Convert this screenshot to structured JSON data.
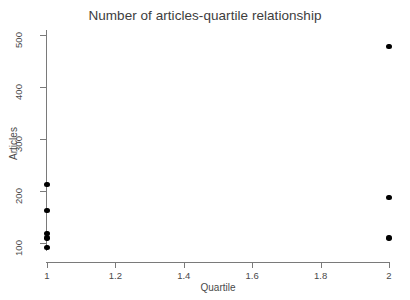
{
  "chart_data": {
    "type": "scatter",
    "title": "Number of articles-quartile relationship",
    "xlabel": "Quartile",
    "ylabel": "Articles",
    "xlim": [
      1,
      2
    ],
    "ylim": [
      80,
      510
    ],
    "grid": false,
    "legend": null,
    "marker": {
      "shape": "circle",
      "filled": true,
      "color": "#000000",
      "size_px": 5.4
    },
    "x_ticks": [
      {
        "value": 1,
        "label": "1"
      },
      {
        "value": 1.2,
        "label": "1.2"
      },
      {
        "value": 1.4,
        "label": "1.4"
      },
      {
        "value": 1.6,
        "label": "1.6"
      },
      {
        "value": 1.8,
        "label": "1.8"
      },
      {
        "value": 2,
        "label": "2"
      }
    ],
    "y_ticks": [
      {
        "value": 100,
        "label": "100"
      },
      {
        "value": 200,
        "label": "200"
      },
      {
        "value": 300,
        "label": "300"
      },
      {
        "value": 400,
        "label": "400"
      },
      {
        "value": 500,
        "label": "500"
      }
    ],
    "points": [
      {
        "x": 1,
        "y": 213
      },
      {
        "x": 1,
        "y": 163
      },
      {
        "x": 1,
        "y": 118
      },
      {
        "x": 1,
        "y": 110
      },
      {
        "x": 1,
        "y": 91
      },
      {
        "x": 2,
        "y": 478
      },
      {
        "x": 2,
        "y": 187
      },
      {
        "x": 2,
        "y": 110
      }
    ],
    "axis_color": "#7a7a7a",
    "title_color": "#3d3d3d",
    "background": "#ffffff"
  }
}
